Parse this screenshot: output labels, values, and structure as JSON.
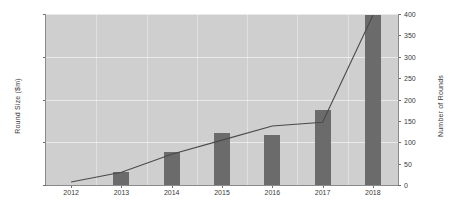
{
  "chart_data": {
    "type": "bar",
    "title": "",
    "xlabel": "",
    "categories": [
      "2012",
      "2013",
      "2014",
      "2015",
      "2016",
      "2017",
      "2018"
    ],
    "series": [
      {
        "name": "Round Size ($m)",
        "type": "bar",
        "axis": "left",
        "values": [
          0,
          150,
          390,
          610,
          590,
          880,
          1990
        ]
      },
      {
        "name": "Number of Rounds",
        "type": "line",
        "axis": "right",
        "values": [
          7,
          30,
          72,
          105,
          138,
          147,
          397
        ]
      }
    ],
    "left_axis": {
      "label": "Round Size ($m)",
      "ticks": [
        0,
        500,
        1000,
        1500,
        2000
      ],
      "ylim": [
        0,
        2000
      ]
    },
    "right_axis": {
      "label": "Number of Rounds",
      "ticks": [
        0,
        50,
        100,
        150,
        200,
        250,
        300,
        350,
        400
      ],
      "ylim": [
        0,
        400
      ]
    },
    "grid": true,
    "legend": "none",
    "colors": {
      "bar": "#6b6b6b",
      "line": "#4a4a4a",
      "plot_background": "#cfcfcf",
      "gridline": "#ffffff",
      "text": "#3a3a3a"
    }
  }
}
